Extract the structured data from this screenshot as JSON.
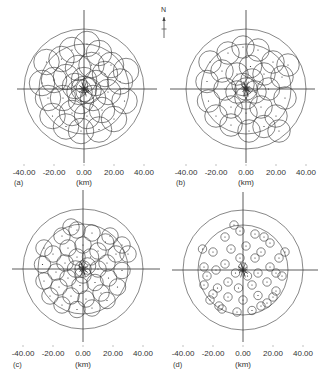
{
  "figure": {
    "north_label": "N",
    "units_label": "(km)",
    "tick_labels": [
      "-40.00",
      "-20.00",
      "0.00",
      "20.00",
      "40.00"
    ],
    "tick_values_km": [
      -40,
      -20,
      0,
      20,
      40
    ],
    "range_rings_km": [
      30,
      40
    ],
    "panels": [
      {
        "id": "a",
        "label": "(a)",
        "cx": 84,
        "cy": 89,
        "label_y": 173,
        "sub_y": 183,
        "cross_x": [
          17,
          157
        ],
        "cross_y": [
          10,
          163
        ],
        "circle_r_km": 8.5,
        "circles": [
          [
            -25,
            18
          ],
          [
            -20,
            6
          ],
          [
            -24,
            -6
          ],
          [
            -21,
            -18
          ],
          [
            -12,
            -25
          ],
          [
            -2,
            -28
          ],
          [
            10,
            -27
          ],
          [
            20,
            -20
          ],
          [
            27,
            -8
          ],
          [
            24,
            5
          ],
          [
            18,
            16
          ],
          [
            10,
            24
          ],
          [
            2,
            30
          ],
          [
            -8,
            26
          ],
          [
            -15,
            20
          ],
          [
            -12,
            8
          ],
          [
            -14,
            -6
          ],
          [
            -8,
            -16
          ],
          [
            2,
            -18
          ],
          [
            12,
            -14
          ],
          [
            16,
            -2
          ],
          [
            14,
            10
          ],
          [
            5,
            16
          ],
          [
            -4,
            14
          ],
          [
            -6,
            2
          ],
          [
            -2,
            -8
          ],
          [
            6,
            -6
          ],
          [
            8,
            4
          ],
          [
            0,
            6
          ],
          [
            -3,
            -2
          ],
          [
            3,
            -1
          ],
          [
            0,
            0
          ],
          [
            28,
            12
          ],
          [
            -28,
            4
          ]
        ]
      },
      {
        "id": "b",
        "label": "(b)",
        "cx": 246,
        "cy": 89,
        "label_y": 173,
        "sub_y": 183,
        "cross_x": [
          170,
          315
        ],
        "cross_y": [
          10,
          163
        ],
        "circle_r_km": 7.5,
        "circles": [
          [
            -24,
            18
          ],
          [
            -26,
            5
          ],
          [
            -25,
            -8
          ],
          [
            -20,
            -18
          ],
          [
            -10,
            -24
          ],
          [
            2,
            -28
          ],
          [
            12,
            -25
          ],
          [
            20,
            -18
          ],
          [
            26,
            -6
          ],
          [
            24,
            8
          ],
          [
            18,
            18
          ],
          [
            8,
            26
          ],
          [
            -2,
            28
          ],
          [
            -12,
            24
          ],
          [
            -16,
            12
          ],
          [
            -14,
            0
          ],
          [
            -10,
            -12
          ],
          [
            0,
            -16
          ],
          [
            10,
            -12
          ],
          [
            15,
            0
          ],
          [
            12,
            10
          ],
          [
            3,
            15
          ],
          [
            -6,
            10
          ],
          [
            -6,
            -2
          ],
          [
            0,
            -6
          ],
          [
            6,
            -2
          ],
          [
            4,
            6
          ],
          [
            -2,
            3
          ],
          [
            0,
            0
          ],
          [
            22,
            -28
          ],
          [
            28,
            16
          ]
        ]
      },
      {
        "id": "c",
        "label": "(c)",
        "cx": 83,
        "cy": 269,
        "label_y": 354,
        "sub_y": 365,
        "cross_x": [
          12,
          160
        ],
        "cross_y": [
          190,
          342
        ],
        "circle_r_km": 5.5,
        "circles": [
          [
            -26,
            14
          ],
          [
            -27,
            3
          ],
          [
            -26,
            -8
          ],
          [
            -22,
            -18
          ],
          [
            -14,
            -24
          ],
          [
            -4,
            -27
          ],
          [
            6,
            -26
          ],
          [
            16,
            -21
          ],
          [
            23,
            -12
          ],
          [
            26,
            -1
          ],
          [
            22,
            10
          ],
          [
            15,
            18
          ],
          [
            6,
            24
          ],
          [
            -4,
            26
          ],
          [
            -14,
            22
          ],
          [
            -20,
            10
          ],
          [
            -18,
            -2
          ],
          [
            -16,
            -12
          ],
          [
            -8,
            -18
          ],
          [
            2,
            -20
          ],
          [
            12,
            -16
          ],
          [
            17,
            -6
          ],
          [
            16,
            4
          ],
          [
            10,
            12
          ],
          [
            0,
            16
          ],
          [
            -10,
            14
          ],
          [
            -12,
            4
          ],
          [
            -10,
            -6
          ],
          [
            -2,
            -11
          ],
          [
            8,
            -9
          ],
          [
            10,
            0
          ],
          [
            5,
            8
          ],
          [
            -4,
            8
          ],
          [
            -5,
            0
          ],
          [
            0,
            -4
          ],
          [
            3,
            2
          ],
          [
            0,
            0
          ],
          [
            18,
            22
          ],
          [
            26,
            16
          ],
          [
            -8,
            28
          ],
          [
            30,
            10
          ]
        ]
      },
      {
        "id": "d",
        "label": "(d)",
        "cx": 243,
        "cy": 270,
        "label_y": 354,
        "sub_y": 365,
        "cross_x": [
          172,
          318
        ],
        "cross_y": [
          192,
          342
        ],
        "circle_r_km": 2.8,
        "circles": [
          [
            -27,
            14
          ],
          [
            -26,
            2
          ],
          [
            -26,
            -10
          ],
          [
            -22,
            -20
          ],
          [
            -14,
            -26
          ],
          [
            -4,
            -28
          ],
          [
            6,
            -27
          ],
          [
            16,
            -22
          ],
          [
            22,
            -14
          ],
          [
            26,
            -4
          ],
          [
            24,
            8
          ],
          [
            18,
            18
          ],
          [
            8,
            24
          ],
          [
            -2,
            26
          ],
          [
            -12,
            22
          ],
          [
            -20,
            12
          ],
          [
            -18,
            0
          ],
          [
            -17,
            -12
          ],
          [
            -10,
            -18
          ],
          [
            0,
            -20
          ],
          [
            10,
            -17
          ],
          [
            16,
            -8
          ],
          [
            18,
            2
          ],
          [
            12,
            12
          ],
          [
            2,
            16
          ],
          [
            -8,
            14
          ],
          [
            -12,
            4
          ],
          [
            -10,
            -8
          ],
          [
            -3,
            -12
          ],
          [
            6,
            -10
          ],
          [
            10,
            -2
          ],
          [
            8,
            8
          ],
          [
            -2,
            8
          ],
          [
            -5,
            -2
          ],
          [
            3,
            -4
          ],
          [
            0,
            2
          ],
          [
            -20,
            -16
          ],
          [
            -24,
            -4
          ],
          [
            20,
            -18
          ],
          [
            14,
            22
          ],
          [
            -6,
            30
          ],
          [
            28,
            12
          ],
          [
            -16,
            -24
          ],
          [
            12,
            -24
          ],
          [
            22,
            -2
          ]
        ]
      }
    ]
  }
}
